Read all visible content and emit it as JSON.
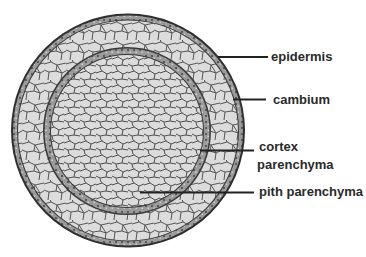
{
  "diagram": {
    "colors": {
      "cell_fill": "#dcdcdc",
      "cell_wall": "#4a4a4a",
      "ring_fill": "#8a8a8a",
      "ring_edge": "#2a2a2a",
      "line": "#222222",
      "text": "#2a2a2a"
    },
    "labels": [
      {
        "id": "epidermis",
        "text": "epidermis"
      },
      {
        "id": "cambium",
        "text": "cambium"
      },
      {
        "id": "cortex",
        "line1": "cortex",
        "line2": "parenchyma"
      },
      {
        "id": "pith",
        "text": "pith parenchyma"
      }
    ]
  }
}
